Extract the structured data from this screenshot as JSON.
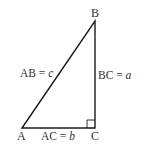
{
  "diagram": {
    "type": "right-triangle",
    "vertices": {
      "A": {
        "label": "A",
        "x": 22,
        "y": 128
      },
      "B": {
        "label": "B",
        "x": 95,
        "y": 21
      },
      "C": {
        "label": "C",
        "x": 95,
        "y": 128
      }
    },
    "right_angle_at": "C",
    "sides": {
      "AB": {
        "name": "AB",
        "eq": " = ",
        "var": "c"
      },
      "BC": {
        "name": "BC",
        "eq": " = ",
        "var": "a"
      },
      "AC": {
        "name": "AC",
        "eq": " = ",
        "var": "b"
      }
    },
    "colors": {
      "line": "#1a1a1a",
      "text": "#333333",
      "background": "#ffffff"
    }
  }
}
